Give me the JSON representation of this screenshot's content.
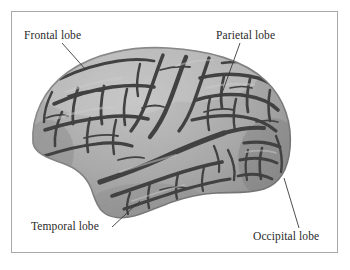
{
  "figure": {
    "kind": "anatomical-illustration",
    "frame_color": "#a9a9a9",
    "background_color": "#ffffff"
  },
  "labels": {
    "frontal": "Frontal lobe",
    "parietal": "Parietal lobe",
    "temporal": "Temporal lobe",
    "occipital": "Occipital lobe"
  },
  "palette": {
    "gyri_light": "#b4b4b4",
    "gyri_mid": "#9a9a9a",
    "sulci_dark": "#3c3c3c",
    "outline": "#5a5a5a",
    "leader_line": "#3a3a3a",
    "text": "#2a2a2a"
  },
  "leaders": [
    {
      "name": "frontal",
      "x1": 62,
      "y1": 43,
      "x2": 86,
      "y2": 70
    },
    {
      "name": "parietal",
      "x1": 240,
      "y1": 43,
      "x2": 221,
      "y2": 96
    },
    {
      "name": "temporal",
      "x1": 112,
      "y1": 227,
      "x2": 140,
      "y2": 201
    },
    {
      "name": "occipital",
      "x1": 284,
      "y1": 178,
      "x2": 299,
      "y2": 228
    }
  ]
}
